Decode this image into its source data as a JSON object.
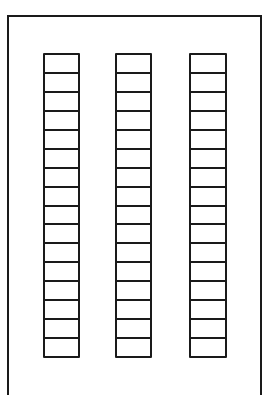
{
  "diagram": {
    "line_color": "#1a1a1a",
    "background": "#ffffff",
    "columns": [
      {
        "id": "column-1",
        "cells": 16,
        "x": 43,
        "width": 37
      },
      {
        "id": "column-2",
        "cells": 16,
        "x": 115,
        "width": 37
      },
      {
        "id": "column-3",
        "cells": 16,
        "x": 189,
        "width": 38
      }
    ],
    "column_top": 53,
    "column_height": 305
  }
}
